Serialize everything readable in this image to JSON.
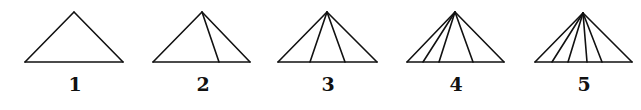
{
  "diagram": {
    "stroke_color": "#111111",
    "background": "#ffffff",
    "triangles": [
      {
        "label": "1",
        "apex": [
          74,
          12
        ],
        "base_left": [
          25,
          62
        ],
        "base_right": [
          123,
          62
        ],
        "inner_lines_base_x": []
      },
      {
        "label": "2",
        "apex": [
          202,
          12
        ],
        "base_left": [
          153,
          62
        ],
        "base_right": [
          250,
          62
        ],
        "inner_lines_base_x": [
          219
        ]
      },
      {
        "label": "3",
        "apex": [
          327,
          12
        ],
        "base_left": [
          278,
          62
        ],
        "base_right": [
          377,
          62
        ],
        "inner_lines_base_x": [
          310,
          345
        ]
      },
      {
        "label": "4",
        "apex": [
          455,
          12
        ],
        "base_left": [
          407,
          62
        ],
        "base_right": [
          504,
          62
        ],
        "inner_lines_base_x": [
          423,
          439,
          473
        ]
      },
      {
        "label": "5",
        "apex": [
          583,
          13
        ],
        "base_left": [
          535,
          62
        ],
        "base_right": [
          632,
          62
        ],
        "inner_lines_base_x": [
          552,
          568,
          587,
          602
        ]
      }
    ],
    "label_y": 91
  }
}
